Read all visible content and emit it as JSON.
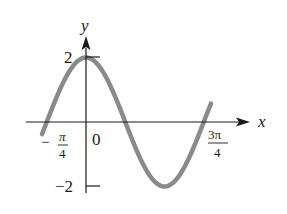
{
  "chart_data": {
    "type": "line",
    "title": "",
    "function": "y = 2cos(2x)",
    "xlabel": "x",
    "ylabel": "y",
    "x_ticks": [
      {
        "value": -0.7853981634,
        "label_num": "π",
        "label_den": "4",
        "label_sign": "−",
        "text": "-π/4"
      },
      {
        "value": 0,
        "text": "0"
      },
      {
        "value": 2.3561944902,
        "label_num": "3π",
        "label_den": "4",
        "label_sign": "",
        "text": "3π/4"
      }
    ],
    "y_ticks": [
      {
        "value": 2,
        "text": "2"
      },
      {
        "value": -2,
        "text": "−2"
      }
    ],
    "xlim": [
      -0.93,
      2.55
    ],
    "ylim": [
      -2,
      2
    ],
    "grid": false,
    "series": [
      {
        "name": "y = 2cos(2x)",
        "color": "#8a8a8a",
        "x": [
          -0.88,
          -0.785,
          -0.6,
          -0.4,
          -0.2,
          0,
          0.2,
          0.4,
          0.6,
          0.785,
          1.0,
          1.2,
          1.4,
          1.5708,
          1.8,
          2.0,
          2.2,
          2.356,
          2.5
        ],
        "values": [
          -0.37,
          0.0,
          0.72,
          1.39,
          1.84,
          2.0,
          1.84,
          1.39,
          0.72,
          0.0,
          -0.83,
          -1.47,
          -1.88,
          -2.0,
          -1.79,
          -1.31,
          -0.62,
          0.0,
          0.57
        ]
      }
    ],
    "annotations": []
  },
  "labels": {
    "x_axis": "x",
    "y_axis": "y",
    "origin": "0",
    "y_max": "2",
    "y_min": "−2",
    "x_left_sign": "−",
    "x_left_num": "π",
    "x_left_den": "4",
    "x_right_num": "3π",
    "x_right_den": "4"
  },
  "colors": {
    "axis": "#1a1a1a",
    "curve": "#8a8a8a"
  }
}
